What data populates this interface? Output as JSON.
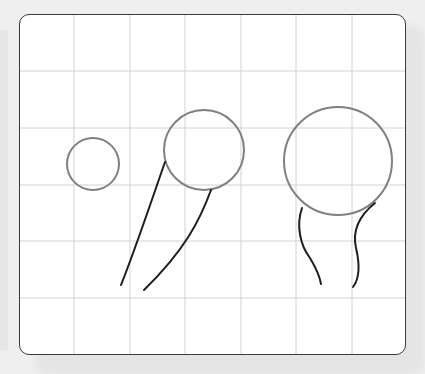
{
  "canvas": {
    "background_color": "#efefef",
    "card_color": "#ffffff",
    "card_border_color": "#3a3a3a",
    "grid_color": "#d2d2d2",
    "grid": {
      "columns": 7,
      "rows": 6
    }
  },
  "drawing": {
    "balloon_color": "#808080",
    "string_color": "#1e1e1e",
    "balloons": [
      {
        "name": "small-balloon",
        "string_count": 0
      },
      {
        "name": "medium-balloon",
        "string_count": 2
      },
      {
        "name": "large-balloon",
        "string_count": 2
      }
    ]
  }
}
